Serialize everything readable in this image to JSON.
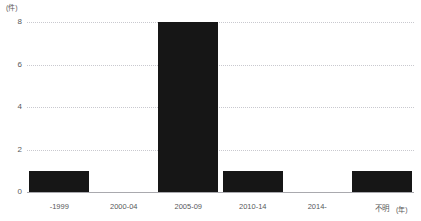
{
  "axes": {
    "y_unit": "(件)",
    "x_unit": "(年)",
    "y_ticks": [
      "8",
      "6",
      "4",
      "2",
      "0"
    ]
  },
  "chart_data": {
    "type": "bar",
    "title": "",
    "subtitle": "",
    "xlabel": "(年)",
    "ylabel": "(件)",
    "categories": [
      "-1999",
      "2000-04",
      "2005-09",
      "2010-14",
      "2014-",
      "不明"
    ],
    "values": [
      1,
      0,
      8,
      1,
      0,
      1
    ],
    "ylim": [
      0,
      8
    ],
    "ytick_values": [
      0,
      2,
      4,
      6,
      8
    ],
    "grid": "horizontal-dotted",
    "legend": "none",
    "bar_color": "#161616",
    "grid_color": "#c9c9cf",
    "axis_color": "#a9a9ae",
    "text_color": "#58585a"
  }
}
